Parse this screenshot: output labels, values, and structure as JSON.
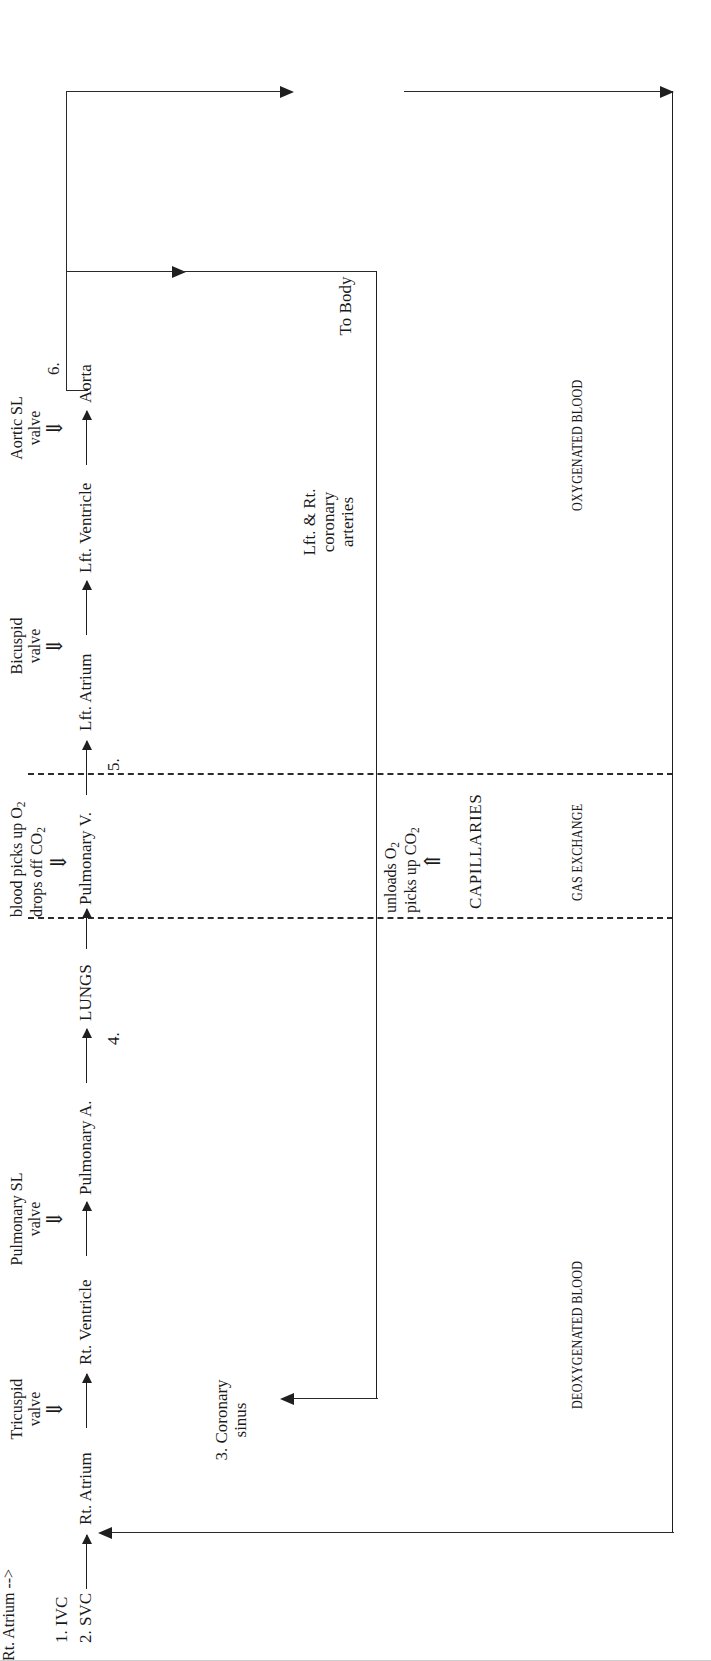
{
  "document": {
    "title": "Blood Flow Through the Heart",
    "orientation": "rotated-90-ccw",
    "background": "#ffffff",
    "ink": "#1f1f1f"
  },
  "inflow": {
    "item1": "1. IVC",
    "item2": "2. SVC"
  },
  "flow_chain": [
    {
      "id": "rt-atrium",
      "label": "Rt. Atrium"
    },
    {
      "id": "rt-ventricle",
      "label": "Rt. Ventricle"
    },
    {
      "id": "pulmonary-a",
      "label": "Pulmonary A."
    },
    {
      "id": "lungs",
      "label": "LUNGS"
    },
    {
      "id": "pulmonary-v",
      "label": "Pulmonary V."
    },
    {
      "id": "lft-atrium",
      "label": "Lft. Atrium"
    },
    {
      "id": "lft-ventricle",
      "label": "Lft. Ventricle"
    },
    {
      "id": "aorta",
      "label": "Aorta"
    }
  ],
  "valves": [
    {
      "id": "tricuspid",
      "name": "Tricuspid",
      "word": "valve",
      "glyph": "⇓"
    },
    {
      "id": "pulmonary-sl",
      "name": "Pulmonary SL",
      "word": "valve",
      "glyph": "⇓"
    },
    {
      "id": "bicuspid",
      "name": "Bicuspid",
      "word": "valve",
      "glyph": "⇓"
    },
    {
      "id": "aortic-sl",
      "name": "Aortic SL",
      "word": "valve",
      "glyph": "⇓"
    }
  ],
  "lung_exchange": {
    "line1_pre": "blood picks up O",
    "line1_sub": "2",
    "line2_pre": "drops off CO",
    "line2_sub": "2",
    "glyph": "⇓"
  },
  "capillary_exchange": {
    "line1_pre": "unloads O",
    "line1_sub": "2",
    "line2_pre": "picks up CO",
    "line2_sub": "2",
    "glyph": "⇑",
    "label": "CAPILLARIES"
  },
  "numbers": {
    "n3": "3. Coronary",
    "n3_line2": "sinus",
    "n4": "4.",
    "n5": "5.",
    "n6": "6."
  },
  "branches": {
    "coronary_line1": "Lft. & Rt.",
    "coronary_line2": "coronary",
    "coronary_line3": "arteries",
    "to_body": "To Body"
  },
  "sections": {
    "deoxygenated": "DEOXYGENATED BLOOD",
    "gas_exchange": "GAS EXCHANGE",
    "oxygenated": "OXYGENATED BLOOD"
  }
}
